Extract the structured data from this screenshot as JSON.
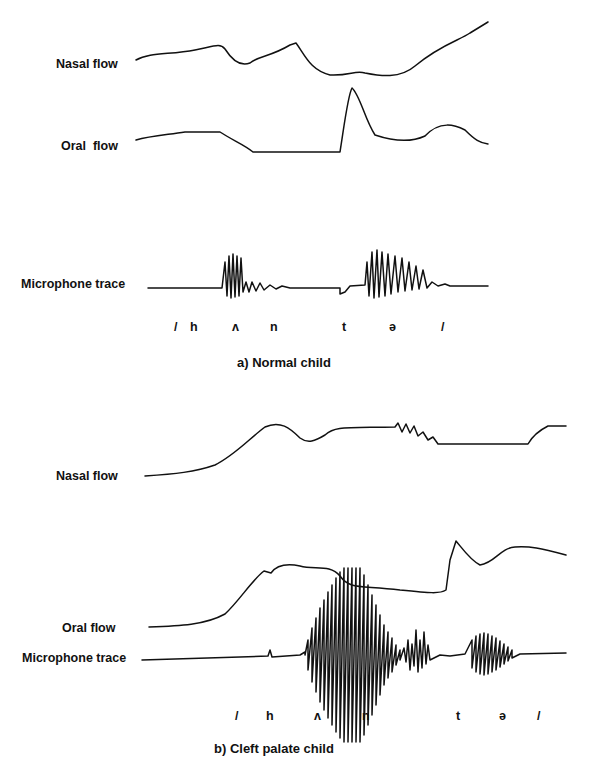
{
  "panel_a": {
    "caption": "a) Normal child",
    "traces": [
      {
        "label": "Nasal flow"
      },
      {
        "label": "Oral  flow"
      },
      {
        "label": "Microphone trace"
      }
    ],
    "phonemes": [
      "/",
      "h",
      "ʌ",
      "n",
      "t",
      "ə",
      "/"
    ]
  },
  "panel_b": {
    "caption": "b) Cleft palate child",
    "traces": [
      {
        "label": "Nasal flow"
      },
      {
        "label": "Oral flow"
      },
      {
        "label": "Microphone trace"
      }
    ],
    "phonemes": [
      "/",
      "h",
      "ʌ",
      "n",
      "t",
      "ə",
      "/"
    ]
  }
}
